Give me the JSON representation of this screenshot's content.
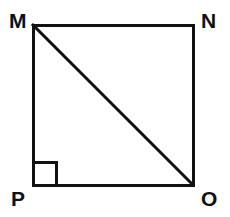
{
  "figure": {
    "name": "square-with-diagonal",
    "canvas": {
      "width": 230,
      "height": 217,
      "background": "#ffffff"
    },
    "stroke": {
      "color": "#111111",
      "width": 3
    },
    "square": {
      "label": "MNOP",
      "x": 33,
      "y": 25,
      "width": 160,
      "height": 160
    },
    "diagonal": {
      "label": "MO",
      "from": "M",
      "to": "O",
      "x1": 33,
      "y1": 25,
      "x2": 193,
      "y2": 185
    },
    "right_angle_marker": {
      "at_vertex": "P",
      "x": 33,
      "y": 162,
      "size": 23
    },
    "vertices": [
      {
        "id": "M",
        "label": "M",
        "x": 33,
        "y": 25
      },
      {
        "id": "N",
        "label": "N",
        "x": 193,
        "y": 25
      },
      {
        "id": "O",
        "label": "O",
        "x": 193,
        "y": 185
      },
      {
        "id": "P",
        "label": "P",
        "x": 33,
        "y": 185
      }
    ]
  }
}
